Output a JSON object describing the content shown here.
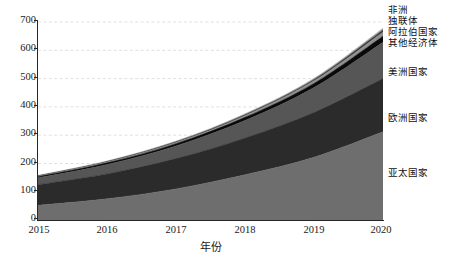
{
  "chart_data": {
    "type": "area",
    "stacked": true,
    "title": "",
    "subtitle": "",
    "xlabel": "年份",
    "ylabel": "",
    "categories": [
      "2015",
      "2016",
      "2017",
      "2018",
      "2019",
      "2020"
    ],
    "x": [
      2015,
      2016,
      2017,
      2018,
      2019,
      2020
    ],
    "xlim": [
      2015,
      2020
    ],
    "ylim": [
      0,
      730
    ],
    "yticks": [
      0,
      100,
      200,
      300,
      400,
      500,
      600,
      700
    ],
    "ytick_labels": [
      "0",
      "100",
      "200",
      "300",
      "400",
      "500",
      "600",
      "700"
    ],
    "xtick_labels": [
      "2015",
      "2016",
      "2017",
      "2018",
      "2019",
      "2020"
    ],
    "grid": "horizontal-dashed",
    "legend_position": "right-outside",
    "series": [
      {
        "name": "亚太国家",
        "color": "#6e6e6e",
        "values": [
          52,
          75,
          110,
          160,
          222,
          312
        ]
      },
      {
        "name": "欧洲国家",
        "color": "#2b2b2b",
        "values": [
          73,
          88,
          107,
          130,
          158,
          188
        ]
      },
      {
        "name": "美洲国家",
        "color": "#565656",
        "values": [
          24,
          33,
          45,
          62,
          88,
          128
        ]
      },
      {
        "name": "其他经济体",
        "color": "#0a0a0a",
        "values": [
          4,
          6,
          8,
          11,
          15,
          22
        ]
      },
      {
        "name": "阿拉伯国家",
        "color": "#8f8f8f",
        "values": [
          2,
          3,
          4,
          6,
          9,
          14
        ]
      },
      {
        "name": "独联体",
        "color": "#3a3a3a",
        "values": [
          1.5,
          2,
          2.5,
          3.5,
          5,
          8
        ]
      },
      {
        "name": "非洲",
        "color": "#a8a8a8",
        "values": [
          1.5,
          2,
          2.5,
          3,
          4,
          6
        ]
      }
    ],
    "totals": [
      158,
      209,
      279,
      375.5,
      501,
      678
    ]
  },
  "axes": {
    "y_ticks": [
      {
        "label": "700",
        "value": 700
      },
      {
        "label": "600",
        "value": 600
      },
      {
        "label": "500",
        "value": 500
      },
      {
        "label": "400",
        "value": 400
      },
      {
        "label": "300",
        "value": 300
      },
      {
        "label": "200",
        "value": 200
      },
      {
        "label": "100",
        "value": 100
      },
      {
        "label": "0",
        "value": 0
      }
    ],
    "x_ticks": [
      {
        "label": "2015",
        "value": 2015
      },
      {
        "label": "2016",
        "value": 2016
      },
      {
        "label": "2017",
        "value": 2017
      },
      {
        "label": "2018",
        "value": 2018
      },
      {
        "label": "2019",
        "value": 2019
      },
      {
        "label": "2020",
        "value": 2020
      }
    ],
    "x_title": "年份"
  },
  "legend": {
    "items": [
      {
        "label": "非洲",
        "color": "#a8a8a8"
      },
      {
        "label": "独联体",
        "color": "#3a3a3a"
      },
      {
        "label": "阿拉伯国家",
        "color": "#8f8f8f"
      },
      {
        "label": "其他经济体",
        "color": "#0a0a0a"
      },
      {
        "label": "美洲国家",
        "color": "#565656"
      },
      {
        "label": "欧洲国家",
        "color": "#2b2b2b"
      },
      {
        "label": "亚太国家",
        "color": "#6e6e6e"
      }
    ]
  },
  "colors": {
    "background": "#ffffff",
    "axis": "#262626",
    "grid": "#d8d8d8",
    "text": "#1a1a1a"
  }
}
